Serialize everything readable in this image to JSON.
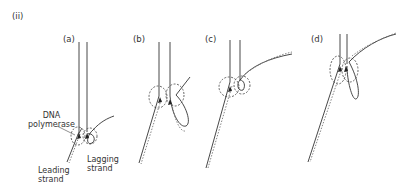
{
  "figure": {
    "part_label": "(ii)",
    "panels": [
      {
        "id": "a",
        "label": "(a)"
      },
      {
        "id": "b",
        "label": "(b)"
      },
      {
        "id": "c",
        "label": "(c)"
      },
      {
        "id": "d",
        "label": "(d)"
      }
    ],
    "annotations": {
      "dna_polymerase_line1": "DNA",
      "dna_polymerase_line2": "polymerase",
      "leading_strand_line1": "Leading",
      "leading_strand_line2": "strand",
      "lagging_strand_line1": "Lagging",
      "lagging_strand_line2": "strand"
    }
  }
}
